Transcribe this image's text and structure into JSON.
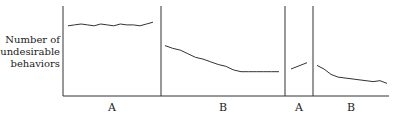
{
  "chart_data": {
    "type": "line",
    "title": "",
    "ylabel_lines": [
      "Number of",
      "undesirable",
      "behaviors"
    ],
    "xlabel": "",
    "design": "ABAB reversal design",
    "phases": [
      {
        "label": "A",
        "values": [
          78,
          79,
          80,
          79,
          78,
          80,
          79,
          78,
          80,
          79,
          79,
          78,
          80,
          82
        ]
      },
      {
        "label": "B",
        "values": [
          56,
          53,
          51,
          47,
          43,
          41,
          38,
          35,
          33,
          29,
          27,
          27,
          27,
          27,
          27,
          27
        ]
      },
      {
        "label": "A",
        "values": [
          30,
          37
        ]
      },
      {
        "label": "B",
        "values": [
          34,
          30,
          24,
          21,
          20,
          19,
          18,
          17,
          16,
          17,
          14
        ]
      }
    ],
    "yrange": [
      0,
      100
    ],
    "grid": false,
    "legend": "none"
  }
}
